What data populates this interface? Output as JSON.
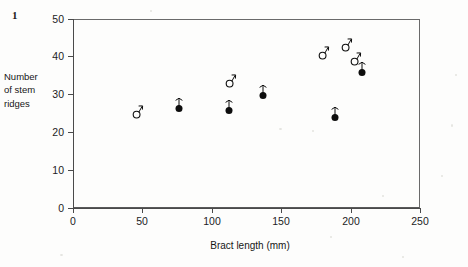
{
  "figure": {
    "label": "1"
  },
  "axes": {
    "x_title": "Bract length (mm)",
    "y_title_lines": [
      "Number",
      "of stem",
      "ridges"
    ],
    "x_ticks": [
      "0",
      "50",
      "100",
      "150",
      "200",
      "250"
    ],
    "y_ticks": [
      "0",
      "10",
      "20",
      "30",
      "40",
      "50"
    ]
  },
  "colors": {
    "axis": "#4a4a4a",
    "frame": "#6a6a6a",
    "text": "#161616",
    "marker_fill": "#0d0d0d",
    "marker_open": "#ffffff"
  },
  "chart_data": {
    "type": "scatter",
    "title": "",
    "xlabel": "Bract length (mm)",
    "ylabel": "Number of stem ridges",
    "xlim": [
      0,
      250
    ],
    "ylim": [
      0,
      50
    ],
    "xticks": [
      0,
      50,
      100,
      150,
      200,
      250
    ],
    "yticks": [
      0,
      10,
      20,
      30,
      40,
      50
    ],
    "grid": false,
    "legend": "none",
    "series": [
      {
        "name": "male",
        "marker": "male-symbol-open-circle",
        "points": [
          {
            "x": 46,
            "y": 25
          },
          {
            "x": 113,
            "y": 33
          },
          {
            "x": 180,
            "y": 40.5
          },
          {
            "x": 197,
            "y": 42.5
          },
          {
            "x": 203,
            "y": 39
          }
        ]
      },
      {
        "name": "female",
        "marker": "female-symbol-filled-circle",
        "points": [
          {
            "x": 76,
            "y": 26.5
          },
          {
            "x": 112,
            "y": 26
          },
          {
            "x": 137,
            "y": 30
          },
          {
            "x": 189,
            "y": 24
          },
          {
            "x": 208,
            "y": 36
          }
        ]
      }
    ]
  }
}
